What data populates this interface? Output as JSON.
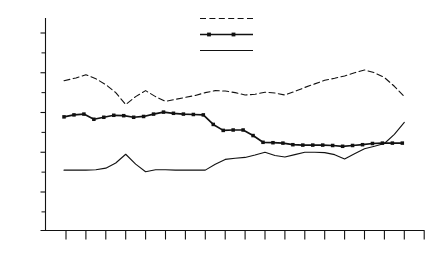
{
  "chart_data": {
    "type": "line",
    "title": "",
    "subtitle": "",
    "xlabel": "",
    "ylabel": "",
    "xlim": [
      1969.5,
      1988.0
    ],
    "ylim": [
      2.5,
      53.0
    ],
    "grid": false,
    "legend_position": "top-center",
    "y_ticks_major": [
      10,
      20,
      30,
      40,
      50
    ],
    "y_ticks_major_labels": [
      "10%",
      "20%",
      "30%",
      "40%",
      "50%"
    ],
    "y_ticks_minor": [
      5,
      15,
      25,
      35,
      45
    ],
    "x_ticks": [
      1970,
      1971,
      1972,
      1973,
      1974,
      1975,
      1976,
      1977,
      1978,
      1979,
      1980,
      1981,
      1982,
      1983,
      1984,
      1985,
      1986,
      1987,
      1988
    ],
    "x_tick_labels_upper": [
      "1971",
      "1973",
      "1975",
      "1977",
      "1979",
      "1981",
      "1983",
      "1985",
      "1987"
    ],
    "x_tick_labels_lower": [
      "1970",
      "1972",
      "1974",
      "1976",
      "1978",
      "1980",
      "1982",
      "1984",
      "1986",
      "1988"
    ],
    "series": [
      {
        "name": "Soviet Union",
        "style": "dashed",
        "marker": "none",
        "color": "#111111",
        "x": [
          1969.9,
          1970.5,
          1971.0,
          1971.5,
          1972.0,
          1972.5,
          1973.0,
          1973.5,
          1974.0,
          1974.5,
          1975.0,
          1975.5,
          1976.0,
          1976.5,
          1977.0,
          1977.5,
          1978.0,
          1978.5,
          1979.0,
          1979.5,
          1980.0,
          1980.5,
          1981.0,
          1981.5,
          1982.0,
          1982.5,
          1983.0,
          1983.5,
          1984.0,
          1984.5,
          1985.0,
          1985.5,
          1986.0,
          1986.5,
          1987.0
        ],
        "values": [
          38.0,
          38.7,
          39.5,
          38.5,
          37.0,
          35.0,
          32.0,
          34.0,
          35.5,
          34.0,
          32.8,
          33.3,
          33.8,
          34.3,
          35.0,
          35.5,
          35.4,
          35.0,
          34.4,
          34.6,
          35.1,
          34.9,
          34.4,
          35.3,
          36.3,
          37.2,
          38.1,
          38.6,
          39.2,
          40.0,
          40.7,
          40.0,
          38.8,
          36.6,
          34.0
        ]
      },
      {
        "name": "CMEA-6",
        "style": "solid",
        "marker": "filled-square",
        "color": "#111111",
        "x": [
          1969.9,
          1970.4,
          1970.9,
          1971.4,
          1971.9,
          1972.4,
          1972.9,
          1973.4,
          1973.9,
          1974.4,
          1974.9,
          1975.4,
          1975.9,
          1976.4,
          1976.9,
          1977.4,
          1977.9,
          1978.4,
          1978.9,
          1979.4,
          1979.9,
          1980.4,
          1980.9,
          1981.4,
          1981.9,
          1982.4,
          1982.9,
          1983.4,
          1983.9,
          1984.4,
          1984.9,
          1985.4,
          1985.9,
          1986.4,
          1986.9
        ],
        "values": [
          28.9,
          29.4,
          29.6,
          28.3,
          28.8,
          29.3,
          29.2,
          28.8,
          29.0,
          29.6,
          30.1,
          29.8,
          29.6,
          29.5,
          29.4,
          27.0,
          25.5,
          25.6,
          25.6,
          24.2,
          22.5,
          22.4,
          22.3,
          21.9,
          21.8,
          21.8,
          21.8,
          21.7,
          21.5,
          21.7,
          21.9,
          22.2,
          22.3,
          22.3,
          22.3
        ]
      },
      {
        "name": "U.S. and EEC",
        "style": "solid",
        "marker": "none",
        "color": "#111111",
        "x": [
          1969.9,
          1970.5,
          1971.0,
          1971.5,
          1972.0,
          1972.5,
          1973.0,
          1973.5,
          1974.0,
          1974.5,
          1975.0,
          1975.5,
          1976.0,
          1976.5,
          1977.0,
          1977.5,
          1978.0,
          1978.5,
          1979.0,
          1979.5,
          1980.0,
          1980.5,
          1981.0,
          1981.5,
          1982.0,
          1982.5,
          1983.0,
          1983.5,
          1984.0,
          1984.5,
          1985.0,
          1985.5,
          1986.0,
          1986.5,
          1987.0
        ],
        "values": [
          15.5,
          15.5,
          15.5,
          15.6,
          16.0,
          17.3,
          19.5,
          17.0,
          15.1,
          15.6,
          15.6,
          15.5,
          15.5,
          15.5,
          15.5,
          17.0,
          18.2,
          18.5,
          18.7,
          19.3,
          20.0,
          19.2,
          18.8,
          19.4,
          20.0,
          20.0,
          19.9,
          19.4,
          18.3,
          19.6,
          20.9,
          21.5,
          22.2,
          24.5,
          27.5
        ]
      }
    ],
    "legend": [
      {
        "label": "Soviet Union",
        "style": "dashed",
        "marker": "none"
      },
      {
        "label": "CMEA-6",
        "style": "solid",
        "marker": "filled-square"
      },
      {
        "label": "U.S. and EEC",
        "style": "solid",
        "marker": "none"
      }
    ]
  }
}
